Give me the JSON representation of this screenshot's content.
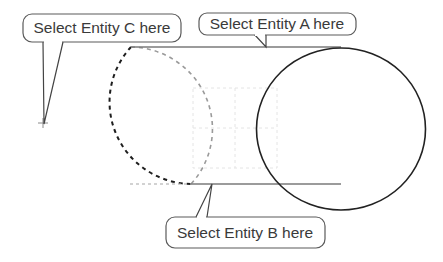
{
  "diagram": {
    "callouts": [
      {
        "id": "C",
        "label": "Select Entity C here"
      },
      {
        "id": "A",
        "label": "Select Entity A here"
      },
      {
        "id": "B",
        "label": "Select Entity B here"
      }
    ],
    "entities": {
      "A": "top tangent line",
      "B": "bottom tangent line",
      "C": "dashed circle (left)"
    },
    "colors": {
      "solid_stroke": "#222222",
      "line_stroke": "#7a7a7a",
      "dashed_black": "#1e1e1e",
      "dashed_gray": "#9a9a9a",
      "grid": "#e2e2e2",
      "callout_border": "#5a5a5a"
    }
  }
}
